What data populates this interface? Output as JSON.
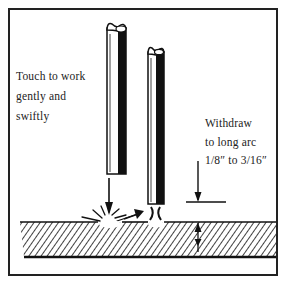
{
  "diagram": {
    "colors": {
      "ink": "#111111",
      "paper": "#ffffff",
      "text": "#222222"
    },
    "labels": {
      "touch": {
        "lines": [
          "Touch to work",
          "gently and",
          "swiftly"
        ]
      },
      "withdraw": {
        "lines": [
          "Withdraw",
          "to long arc",
          "1/8″ to 3/16″"
        ]
      }
    },
    "elements": {
      "electrode_touching": "electrode-1",
      "electrode_withdrawn": "electrode-2",
      "workpiece": "hatched-plate",
      "sparks": "spark-burst",
      "arc": "arc-gap",
      "dimension": "arc-length-dimension"
    }
  }
}
